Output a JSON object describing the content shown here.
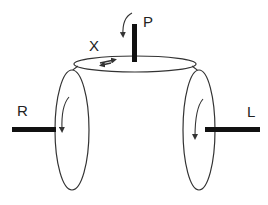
{
  "diagram": {
    "labels": {
      "top_axle": "P",
      "top_disk": "X",
      "left_axle": "R",
      "right_axle": "L"
    },
    "colors": {
      "stroke": "#333333",
      "axle": "#111111",
      "text": "#222222",
      "background": "#ffffff"
    },
    "components": [
      {
        "id": "top-disk",
        "shape": "ellipse",
        "orientation": "horizontal",
        "axle": "P",
        "rotation_arrow": "curved arrow above axle pointing down",
        "surface_marker": "double arrow"
      },
      {
        "id": "left-disk",
        "shape": "ellipse",
        "orientation": "vertical",
        "axle": "R",
        "rotation_arrow": "downward curved arrow"
      },
      {
        "id": "right-disk",
        "shape": "ellipse",
        "orientation": "vertical",
        "axle": "L",
        "rotation_arrow": "downward curved arrow"
      }
    ]
  }
}
